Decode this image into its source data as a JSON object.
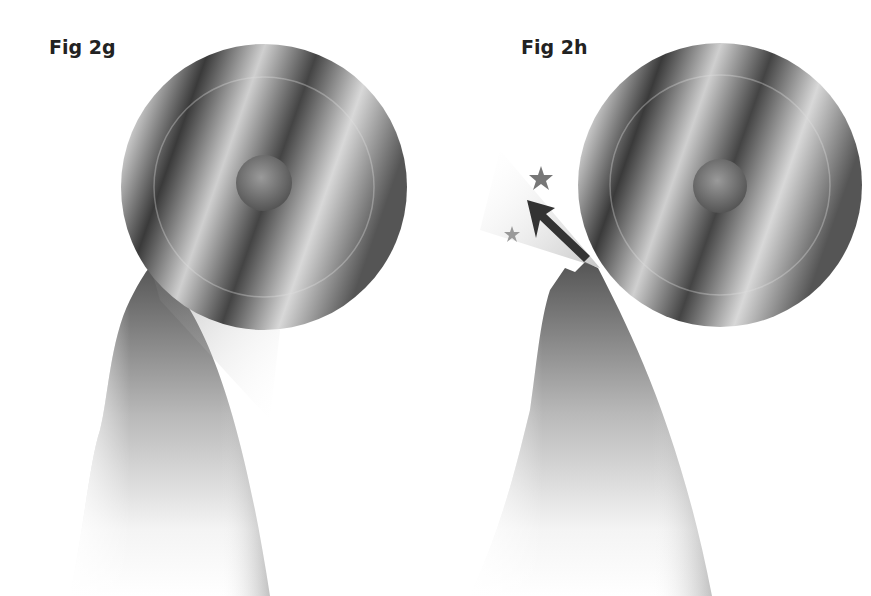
{
  "figures": [
    {
      "label": "Fig 2g",
      "description": "grinding wheel contacting cutting edge, sparks/streaks flowing down the side"
    },
    {
      "label": "Fig 2h",
      "description": "grinding wheel chipping cutting edge, stars and arrow indicating fracture"
    }
  ],
  "colors": {
    "background": "#ffffff",
    "ink": "#222222",
    "wheel_dark": "#3a3a3a",
    "wheel_light": "#d8d8d8"
  }
}
